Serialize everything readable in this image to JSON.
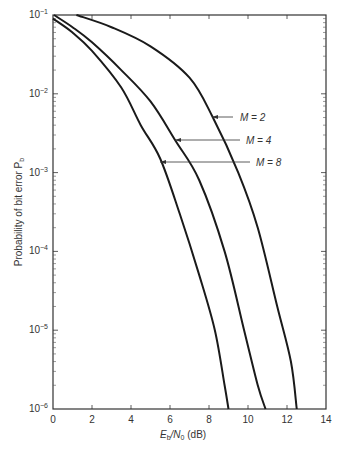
{
  "chart_data": {
    "type": "line",
    "title": "",
    "xlabel": "E_b/N_0 (dB)",
    "ylabel": "Probability of bit error P_b",
    "xlim": [
      0,
      14
    ],
    "ylim": [
      1e-06,
      0.1
    ],
    "yscale": "log",
    "x_ticks": [
      "0",
      "2",
      "4",
      "6",
      "8",
      "10",
      "12",
      "14"
    ],
    "y_ticks": [
      "10^-1",
      "10^-2",
      "10^-3",
      "10^-4",
      "10^-5",
      "10^-6"
    ],
    "grid": false,
    "series": [
      {
        "name": "M = 2",
        "x": [
          1.2,
          3,
          5,
          7,
          8.2,
          9.5,
          10.5,
          11.5,
          12.2,
          12.5
        ],
        "y": [
          0.1,
          0.07,
          0.04,
          0.016,
          0.005,
          0.001,
          0.0002,
          2e-05,
          4e-06,
          1e-06
        ]
      },
      {
        "name": "M = 4",
        "x": [
          0.05,
          1,
          2,
          3.5,
          5,
          6.3,
          7.5,
          8.8,
          9.8,
          10.5,
          10.9
        ],
        "y": [
          0.1,
          0.07,
          0.045,
          0.02,
          0.008,
          0.0025,
          0.0008,
          0.0001,
          1e-05,
          2e-06,
          1e-06
        ]
      },
      {
        "name": "M = 8",
        "x": [
          0,
          1,
          2,
          3.5,
          4.5,
          5.5,
          6.5,
          7.5,
          8.3,
          8.8,
          9.0
        ],
        "y": [
          0.09,
          0.06,
          0.035,
          0.012,
          0.004,
          0.0015,
          0.0003,
          5e-05,
          1e-05,
          2e-06,
          1e-06
        ]
      }
    ],
    "annotations": [
      {
        "text": "M = 2",
        "arrow_to": [
          8.2,
          0.005
        ]
      },
      {
        "text": "M = 4",
        "arrow_to": [
          6.3,
          0.0025
        ]
      },
      {
        "text": "M = 8",
        "arrow_to": [
          5.5,
          0.0015
        ]
      }
    ]
  },
  "labels": {
    "xlabel_main": "E",
    "xlabel_sub1": "b",
    "xlabel_mid": "/N",
    "xlabel_sub2": "0",
    "xlabel_tail": " (dB)",
    "ylabel_main": "Probability of bit error P",
    "ylabel_sub": "b",
    "m2": "M = 2",
    "m4": "M = 4",
    "m8": "M = 8",
    "ytick_base": "10",
    "yexp": [
      "−1",
      "−2",
      "−3",
      "−4",
      "−5",
      "−6"
    ],
    "xticks": [
      "0",
      "2",
      "4",
      "6",
      "8",
      "10",
      "12",
      "14"
    ]
  }
}
